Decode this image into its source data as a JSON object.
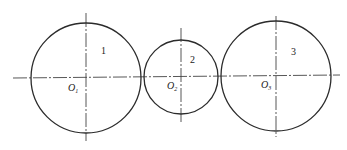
{
  "diagram": {
    "circles": [
      {
        "id": "1",
        "number_label": "1",
        "center_label": "O",
        "center_sub": "1",
        "cx": 86,
        "cy": 78,
        "r": 55
      },
      {
        "id": "2",
        "number_label": "2",
        "center_label": "O",
        "center_sub": "2",
        "cx": 181,
        "cy": 77,
        "r": 37
      },
      {
        "id": "3",
        "number_label": "3",
        "center_label": "O",
        "center_sub": "3",
        "cx": 276,
        "cy": 76,
        "r": 55
      }
    ],
    "stroke_color": "#2b2b2b"
  }
}
